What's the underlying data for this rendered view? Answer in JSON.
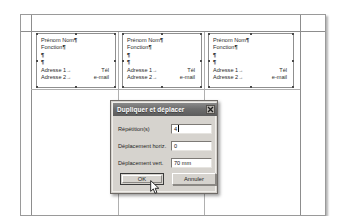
{
  "app": {
    "type": "desktop-publishing-document",
    "language": "fr"
  },
  "document": {
    "page_label": "",
    "cards": [
      {
        "name_line": "Prénom Nom",
        "role_line": "Fonction",
        "empty_line_1": "",
        "empty_line_2": "",
        "address_1": "Adresse 1",
        "phone": "Tél",
        "address_2": "Adresse 2",
        "email": "e-mail",
        "pilcrow": "¶",
        "tab_arrow": "→"
      },
      {
        "name_line": "Prénom Nom",
        "role_line": "Fonction",
        "empty_line_1": "",
        "empty_line_2": "",
        "address_1": "Adresse 1",
        "phone": "Tél",
        "address_2": "Adresse 2",
        "email": "e-mail",
        "pilcrow": "¶",
        "tab_arrow": "→"
      },
      {
        "name_line": "Prénom Nom",
        "role_line": "Fonction",
        "empty_line_1": "",
        "empty_line_2": "",
        "address_1": "Adresse 1",
        "phone": "Tél",
        "address_2": "Adresse 2",
        "email": "e-mail",
        "pilcrow": "¶",
        "tab_arrow": "→"
      }
    ]
  },
  "dialog": {
    "title": "Dupliquer et déplacer",
    "close_icon": "close-x-icon",
    "fields": [
      {
        "label": "Répétition(s)",
        "value": "4",
        "focused": true
      },
      {
        "label": "Déplacement horiz.",
        "value": "0",
        "focused": false
      },
      {
        "label": "Déplacement vert.",
        "value": "70 mm",
        "focused": false
      }
    ],
    "buttons": {
      "ok": "OK",
      "cancel": "Annuler"
    }
  },
  "colors": {
    "dialog_face": "#d6d3ce",
    "titlebar": "#6d6d6d",
    "card_border": "#8f8f8f",
    "guide": "#b0b0b0",
    "text": "#1f1f1f"
  },
  "cursor": {
    "icon": "mouse-pointer-arrow",
    "x": 150,
    "y": 180
  }
}
